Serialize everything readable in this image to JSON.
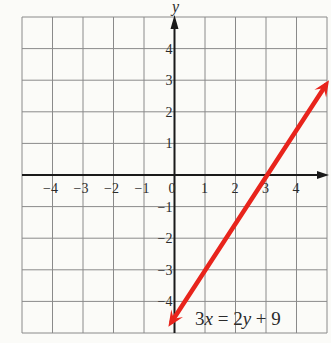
{
  "chart_data": {
    "type": "line",
    "title": "",
    "xlabel": "",
    "ylabel": "y",
    "xlim": [
      -5,
      5
    ],
    "ylim": [
      -5,
      5
    ],
    "grid": true,
    "x_ticks": [
      -4,
      -3,
      -2,
      -1,
      0,
      1,
      2,
      3,
      4
    ],
    "y_ticks": [
      4,
      3,
      2,
      1,
      -1,
      -2,
      -3,
      -4
    ],
    "x_tick_labels": [
      "−4",
      "−3",
      "−2",
      "−1",
      "0",
      "1",
      "2",
      "3",
      "4"
    ],
    "y_tick_labels": [
      "4",
      "3",
      "2",
      "1",
      "−1",
      "−2",
      "−3",
      "−4"
    ],
    "series": [
      {
        "name": "3x = 2y + 9",
        "equation": "3x = 2y + 9",
        "slope": 1.5,
        "intercept": -4.5,
        "color": "#e8241c",
        "x": [
          -0.2,
          0,
          1,
          2,
          3,
          4,
          5
        ],
        "y": [
          -4.8,
          -4.5,
          -3,
          -1.5,
          0,
          1.5,
          3
        ],
        "arrows": "both"
      }
    ],
    "annotations": [
      {
        "text_parts": [
          "3",
          "x",
          " = 2",
          "y",
          " + 9"
        ],
        "x": 0.85,
        "y": -4.55
      }
    ]
  },
  "labels": {
    "y_axis": "y",
    "equation": {
      "p1": "3",
      "p2": "x",
      "p3": " = 2",
      "p4": "y",
      "p5": " + 9"
    }
  },
  "colors": {
    "line": "#e8241c",
    "grid": "#8a8a8a",
    "axis": "#1a1a1a",
    "background": "#fbfbf8"
  }
}
